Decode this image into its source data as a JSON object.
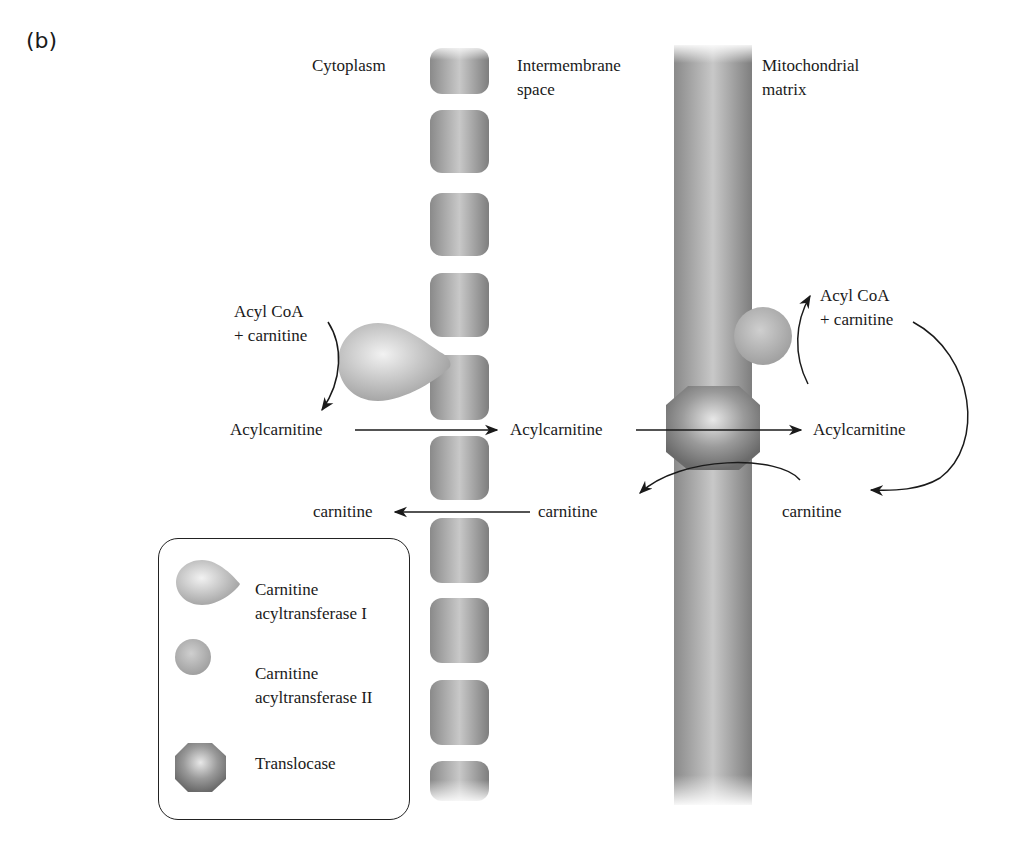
{
  "panel_label": "(b)",
  "regions": {
    "cytoplasm": "Cytoplasm",
    "intermembrane_line1": "Intermembrane",
    "intermembrane_line2": "space",
    "matrix_line1": "Mitochondrial",
    "matrix_line2": "matrix"
  },
  "reactions": {
    "left_substrate_line1": "Acyl CoA",
    "left_substrate_line2": "+ carnitine",
    "acylcarnitine_cytoplasm": "Acylcarnitine",
    "acylcarnitine_intermembrane": "Acylcarnitine",
    "acylcarnitine_matrix": "Acylcarnitine",
    "right_product_line1": "Acyl CoA",
    "right_product_line2": "+ carnitine",
    "carnitine_cytoplasm": "carnitine",
    "carnitine_intermembrane": "carnitine",
    "carnitine_matrix": "carnitine"
  },
  "legend": {
    "items": [
      {
        "shape": "teardrop",
        "line1": "Carnitine",
        "line2": "acyltransferase I"
      },
      {
        "shape": "sphere",
        "line1": "Carnitine",
        "line2": "acyltransferase II"
      },
      {
        "shape": "octagon",
        "line1": "Translocase",
        "line2": ""
      }
    ]
  },
  "colors": {
    "membrane_dark": "#7a7a7a",
    "membrane_light": "#c4c4c4",
    "enzyme_light": "#e6e6e6",
    "enzyme_mid": "#a8a8a8",
    "translocase_dark": "#6a6a6a",
    "arrow": "#1a1a1a"
  }
}
